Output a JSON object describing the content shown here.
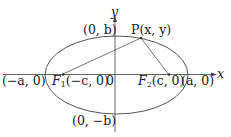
{
  "diagram": {
    "colors": {
      "stroke": "#444444",
      "text": "#222222",
      "background": "#ffffff"
    },
    "axes": {
      "x_label": "x",
      "y_label": "y",
      "origin_label": "0"
    },
    "points": {
      "top_vertex": "(0, b)",
      "bottom_vertex": "(0, −b)",
      "left_vertex": "(−a, 0)",
      "right_vertex": "(a, 0)",
      "focus1": {
        "name": "F",
        "sub": "1",
        "coords": "(−c, 0)"
      },
      "focus2": {
        "name": "F",
        "sub": "2",
        "coords": "(c, 0)"
      },
      "point_p": "P(x, y)"
    }
  }
}
